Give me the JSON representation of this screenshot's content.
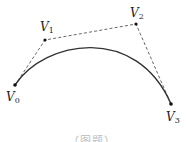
{
  "figure": {
    "type": "cubic-bezier-curve",
    "control_polygon_style": "dashed",
    "curve_style": "solid",
    "colors": {
      "curve": "#333333",
      "polygon": "#555555",
      "point": "#111111",
      "background": "#ffffff"
    },
    "points": [
      {
        "id": "V0",
        "name": "V",
        "sub": "0",
        "x": 15,
        "y": 85
      },
      {
        "id": "V1",
        "name": "V",
        "sub": "1",
        "x": 45,
        "y": 40
      },
      {
        "id": "V2",
        "name": "V",
        "sub": "2",
        "x": 136,
        "y": 24
      },
      {
        "id": "V3",
        "name": "V",
        "sub": "3",
        "x": 171,
        "y": 104
      }
    ],
    "caption": "（图题）"
  }
}
